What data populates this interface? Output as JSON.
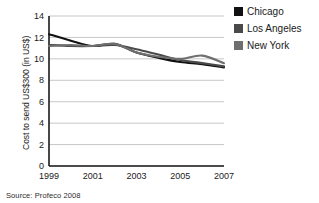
{
  "source": {
    "text": "Source: Profeco 2008"
  },
  "legend": {
    "position": "top-right",
    "entries": [
      {
        "label": "Chicago",
        "color": "#111111"
      },
      {
        "label": "Los Angeles",
        "color": "#4a4a4a"
      },
      {
        "label": "New York",
        "color": "#6f6f6f"
      }
    ]
  },
  "chart_data": {
    "type": "line",
    "title": "",
    "subtitle": "",
    "xlabel": "",
    "ylabel": "Cost to send US$300 (in US$)",
    "xlim": [
      1999,
      2007
    ],
    "ylim": [
      0,
      14
    ],
    "yticks": [
      0,
      2,
      4,
      6,
      8,
      10,
      12,
      14
    ],
    "ytick_labels": [
      "0",
      "2",
      "4",
      "6",
      "8",
      "10",
      "12",
      "14"
    ],
    "xticks": [
      1999,
      2001,
      2003,
      2005,
      2007
    ],
    "xtick_labels": [
      "1999",
      "2001",
      "2003",
      "2005",
      "2007"
    ],
    "x": [
      1999,
      2000,
      2001,
      2002,
      2003,
      2004,
      2005,
      2006,
      2007
    ],
    "grid": "horizontal",
    "legend_position": "top-right",
    "series": [
      {
        "name": "Chicago",
        "color": "#111111",
        "values": [
          12.3,
          11.7,
          11.2,
          11.4,
          10.6,
          10.1,
          9.7,
          9.5,
          9.2
        ]
      },
      {
        "name": "Los Angeles",
        "color": "#4a4a4a",
        "values": [
          11.3,
          11.2,
          11.2,
          11.3,
          10.9,
          10.4,
          9.9,
          9.6,
          9.3
        ]
      },
      {
        "name": "New York",
        "color": "#6f6f6f",
        "values": [
          11.2,
          11.3,
          11.2,
          11.4,
          10.6,
          10.2,
          10.0,
          10.3,
          9.6
        ]
      }
    ]
  }
}
